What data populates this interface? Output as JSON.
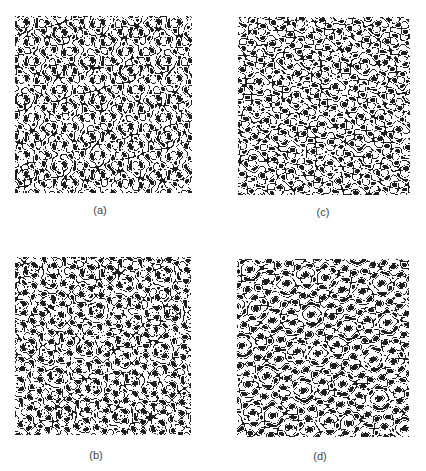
{
  "figure": {
    "background": "#ffffff",
    "ink_color": "#1e1e1e",
    "paper_color": "#ffffff",
    "label_color": "#444444",
    "pattern": {
      "type": "twelve-fold quasiperiodic pattern",
      "symmetry_fold": 12,
      "description": "Black-and-white quasicrystalline pattern of ringed circles (black dot inside white disc with black outline) and clusters of small black dots on a dark network"
    },
    "panels": [
      {
        "id": "a",
        "label": "(a)",
        "box": {
          "x": 15,
          "y": 16,
          "w": 177,
          "h": 177
        },
        "label_pos": {
          "x": 100,
          "y": 204
        },
        "phase_seed": 1,
        "rotation_deg": 0
      },
      {
        "id": "c",
        "label": "(c)",
        "box": {
          "x": 238,
          "y": 17,
          "w": 172,
          "h": 178
        },
        "label_pos": {
          "x": 323,
          "y": 206
        },
        "phase_seed": 3,
        "rotation_deg": 4
      },
      {
        "id": "b",
        "label": "(b)",
        "box": {
          "x": 15,
          "y": 257,
          "w": 176,
          "h": 178
        },
        "label_pos": {
          "x": 96,
          "y": 449
        },
        "phase_seed": 2,
        "rotation_deg": 2
      },
      {
        "id": "d",
        "label": "(d)",
        "box": {
          "x": 237,
          "y": 259,
          "w": 172,
          "h": 178
        },
        "label_pos": {
          "x": 320,
          "y": 450
        },
        "phase_seed": 4,
        "rotation_deg": 6
      }
    ]
  }
}
